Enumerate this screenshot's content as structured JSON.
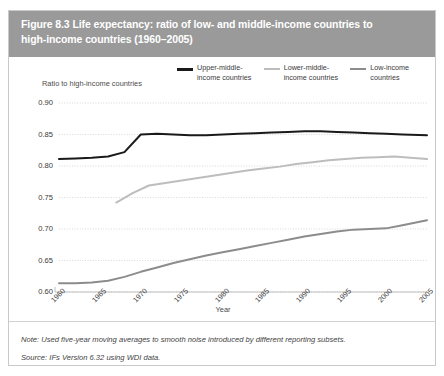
{
  "figure": {
    "title_line1": "Figure 8.3 Life expectancy: ratio of low- and middle-income countries to",
    "title_line2": "high-income countries (1960–2005)",
    "note": "Note: Used five-year moving averages to smooth noise introduced by different reporting subsets.",
    "source": "Source: IFs Version 6.32 using WDI data.",
    "title_bar_color": "#9a9a9a",
    "border_color": "#c9c9c9"
  },
  "chart_data": {
    "type": "line",
    "title": "",
    "xlabel": "Year",
    "ylabel": "Ratio to high-income countries",
    "xlim": [
      1960,
      2005
    ],
    "ylim": [
      0.595,
      0.905
    ],
    "xticks": [
      "1960",
      "1965",
      "1970",
      "1975",
      "1980",
      "1985",
      "1990",
      "1995",
      "2000",
      "2005"
    ],
    "yticks": [
      "0.90",
      "0.85",
      "0.80",
      "0.75",
      "0.70",
      "0.65",
      "0.60"
    ],
    "ytick_values": [
      0.9,
      0.85,
      0.8,
      0.75,
      0.7,
      0.65,
      0.6
    ],
    "grid": true,
    "legend_position": "top-right",
    "series": [
      {
        "name": "Upper-middle-income countries",
        "legend_label_line1": "Upper-middle-",
        "legend_label_line2": "income countries",
        "color": "#1a1a1a",
        "width": 2.0,
        "x": [
          1960,
          1962,
          1964,
          1966,
          1968,
          1970,
          1972,
          1974,
          1976,
          1978,
          1980,
          1982,
          1984,
          1986,
          1988,
          1990,
          1992,
          1994,
          1996,
          1998,
          2000,
          2002,
          2005
        ],
        "y": [
          0.811,
          0.812,
          0.813,
          0.815,
          0.822,
          0.85,
          0.851,
          0.85,
          0.849,
          0.849,
          0.85,
          0.851,
          0.852,
          0.853,
          0.854,
          0.855,
          0.855,
          0.854,
          0.853,
          0.852,
          0.851,
          0.85,
          0.849
        ]
      },
      {
        "name": "Lower-middle-income countries",
        "legend_label_line1": "Lower-middle-",
        "legend_label_line2": "income countries",
        "color": "#bdbdbd",
        "width": 2.0,
        "x": [
          1967,
          1969,
          1971,
          1973,
          1975,
          1977,
          1979,
          1981,
          1983,
          1985,
          1987,
          1989,
          1991,
          1993,
          1995,
          1997,
          1999,
          2001,
          2003,
          2005
        ],
        "y": [
          0.742,
          0.757,
          0.769,
          0.773,
          0.777,
          0.781,
          0.785,
          0.789,
          0.793,
          0.796,
          0.799,
          0.803,
          0.806,
          0.809,
          0.811,
          0.813,
          0.814,
          0.815,
          0.813,
          0.811
        ]
      },
      {
        "name": "Low-income countries",
        "legend_label_line1": "Low-income",
        "legend_label_line2": "countries",
        "color": "#8c8c8c",
        "width": 2.0,
        "x": [
          1960,
          1962,
          1964,
          1966,
          1968,
          1970,
          1972,
          1974,
          1976,
          1978,
          1980,
          1982,
          1984,
          1986,
          1988,
          1990,
          1992,
          1994,
          1996,
          1998,
          2000,
          2002,
          2005
        ],
        "y": [
          0.614,
          0.614,
          0.615,
          0.618,
          0.624,
          0.632,
          0.639,
          0.646,
          0.652,
          0.658,
          0.663,
          0.668,
          0.673,
          0.678,
          0.683,
          0.688,
          0.692,
          0.696,
          0.699,
          0.7,
          0.701,
          0.706,
          0.714
        ]
      }
    ]
  }
}
